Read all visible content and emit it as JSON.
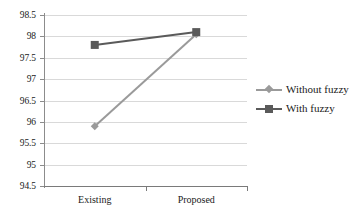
{
  "chart_data": {
    "type": "line",
    "title": "",
    "xlabel": "",
    "ylabel": "",
    "categories": [
      "Existing",
      "Proposed"
    ],
    "series": [
      {
        "name": "Without fuzzy",
        "values": [
          95.9,
          98.05
        ],
        "color": "#9a9a9a",
        "marker": "diamond"
      },
      {
        "name": "With fuzzy",
        "values": [
          97.8,
          98.1
        ],
        "color": "#5a5a5a",
        "marker": "square"
      }
    ],
    "ylim": [
      94.5,
      98.5
    ],
    "ytick_step": 0.5,
    "yticks": [
      98.5,
      98,
      97.5,
      97,
      96.5,
      96,
      95.5,
      95,
      94.5
    ],
    "ytick_labels": [
      "98.5",
      "98",
      "97.5",
      "97",
      "96.5",
      "96",
      "95.5",
      "95",
      "94.5"
    ],
    "grid": true,
    "grid_color": "#d9d9d9",
    "legend_position": "right",
    "axis_color": "#7a7a7a",
    "background": "#ffffff"
  },
  "legend": {
    "items": [
      {
        "label": "Without fuzzy"
      },
      {
        "label": "With fuzzy"
      }
    ]
  }
}
